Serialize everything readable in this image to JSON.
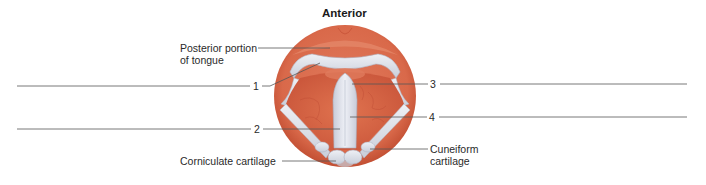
{
  "diagram": {
    "title": "Anterior",
    "labels": {
      "posterior_tongue_line1": "Posterior portion",
      "posterior_tongue_line2": "of tongue",
      "corniculate": "Corniculate cartilage",
      "cuneiform_line1": "Cuneiform",
      "cuneiform_line2": "cartilage"
    },
    "numbered_labels": [
      {
        "number": "1",
        "answer": ""
      },
      {
        "number": "2",
        "answer": ""
      },
      {
        "number": "3",
        "answer": ""
      },
      {
        "number": "4",
        "answer": ""
      }
    ],
    "colors": {
      "tissue": "#d9694a",
      "tissue_dark": "#c9553a",
      "tissue_light": "#e9937a",
      "cartilage": "#e3e6ee",
      "cartilage_shadow": "#b9bfcc",
      "line": "#555555",
      "text": "#2a2a2a"
    }
  }
}
